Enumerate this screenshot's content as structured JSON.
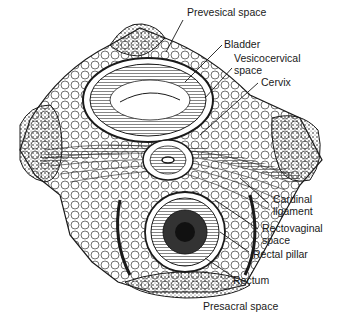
{
  "figure": {
    "labels": {
      "prevesical_space": "Prevesical space",
      "bladder": "Bladder",
      "vesicocervical_space_1": "Vesicocervical",
      "vesicocervical_space_2": "space",
      "cervix": "Cervix",
      "cardinal_ligament_1": "Cardinal",
      "cardinal_ligament_2": "ligament",
      "rectovaginal_space_1": "Rectovaginal",
      "rectovaginal_space_2": "space",
      "rectal_pillar": "Rectal pillar",
      "rectum": "Rectum",
      "presacral_space": "Presacral space"
    },
    "colors": {
      "ink": "#1a1a1a",
      "background": "#ffffff"
    }
  }
}
